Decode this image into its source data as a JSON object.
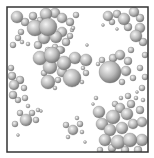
{
  "figure": {
    "background": "#ffffff",
    "box": {
      "x": 7,
      "y": 7,
      "width": 141,
      "height": 145,
      "stroke": "#333333",
      "stroke_width": 1.5
    },
    "sphere_colors": {
      "highlight": "#f4f4f4",
      "mid": "#b8b8b8",
      "shadow": "#6e6e6e"
    },
    "spheres": [
      [
        17,
        17,
        6
      ],
      [
        25,
        22,
        4
      ],
      [
        33,
        16,
        4
      ],
      [
        40,
        20,
        3
      ],
      [
        46,
        14,
        6
      ],
      [
        55,
        13,
        5
      ],
      [
        62,
        18,
        5
      ],
      [
        70,
        22,
        4
      ],
      [
        76,
        15,
        3
      ],
      [
        72,
        30,
        2
      ],
      [
        35,
        28,
        8
      ],
      [
        48,
        27,
        9
      ],
      [
        44,
        38,
        6
      ],
      [
        56,
        37,
        6
      ],
      [
        62,
        32,
        5
      ],
      [
        66,
        42,
        4
      ],
      [
        38,
        45,
        4
      ],
      [
        55,
        47,
        3
      ],
      [
        48,
        50,
        3
      ],
      [
        62,
        50,
        3
      ],
      [
        70,
        36,
        3
      ],
      [
        18,
        38,
        3
      ],
      [
        13,
        45,
        3
      ],
      [
        22,
        42,
        2
      ],
      [
        28,
        44,
        2
      ],
      [
        21,
        32,
        3
      ],
      [
        73,
        28,
        2
      ],
      [
        40,
        58,
        7
      ],
      [
        52,
        55,
        8
      ],
      [
        60,
        50,
        4
      ],
      [
        64,
        63,
        7
      ],
      [
        75,
        58,
        6
      ],
      [
        86,
        60,
        6
      ],
      [
        50,
        67,
        7
      ],
      [
        62,
        72,
        5
      ],
      [
        44,
        73,
        3
      ],
      [
        86,
        73,
        3
      ],
      [
        48,
        82,
        7
      ],
      [
        72,
        78,
        9
      ],
      [
        58,
        80,
        3
      ],
      [
        82,
        82,
        2
      ],
      [
        55,
        88,
        2
      ],
      [
        83,
        68,
        2
      ],
      [
        110,
        72,
        11
      ],
      [
        102,
        60,
        3
      ],
      [
        113,
        58,
        4
      ],
      [
        120,
        55,
        5
      ],
      [
        128,
        61,
        4
      ],
      [
        126,
        71,
        5
      ],
      [
        133,
        78,
        3
      ],
      [
        122,
        82,
        3
      ],
      [
        98,
        64,
        2
      ],
      [
        131,
        50,
        3
      ],
      [
        108,
        16,
        5
      ],
      [
        117,
        14,
        4
      ],
      [
        124,
        19,
        6
      ],
      [
        134,
        12,
        5
      ],
      [
        140,
        18,
        4
      ],
      [
        112,
        22,
        3
      ],
      [
        128,
        27,
        4
      ],
      [
        140,
        28,
        5
      ],
      [
        136,
        36,
        6
      ],
      [
        143,
        42,
        4
      ],
      [
        145,
        55,
        3
      ],
      [
        140,
        68,
        3
      ],
      [
        145,
        77,
        3
      ],
      [
        142,
        88,
        3
      ],
      [
        103,
        25,
        1.5
      ],
      [
        117,
        29,
        1.5
      ],
      [
        87,
        45,
        1.5
      ],
      [
        12,
        76,
        4
      ],
      [
        14,
        85,
        5
      ],
      [
        20,
        80,
        4
      ],
      [
        24,
        88,
        3
      ],
      [
        13,
        95,
        4
      ],
      [
        18,
        100,
        3
      ],
      [
        25,
        98,
        3
      ],
      [
        11,
        68,
        3
      ],
      [
        28,
        106,
        2
      ],
      [
        26,
        120,
        6
      ],
      [
        20,
        113,
        3
      ],
      [
        32,
        113,
        3
      ],
      [
        36,
        120,
        3
      ],
      [
        15,
        124,
        3
      ],
      [
        38,
        110,
        2
      ],
      [
        41,
        111,
        1.5
      ],
      [
        18,
        135,
        1.5
      ],
      [
        73,
        130,
        5
      ],
      [
        66,
        125,
        3
      ],
      [
        80,
        124,
        3
      ],
      [
        77,
        118,
        2
      ],
      [
        82,
        132,
        2
      ],
      [
        68,
        137,
        2
      ],
      [
        85,
        142,
        1.5
      ],
      [
        99,
        112,
        6
      ],
      [
        102,
        124,
        6
      ],
      [
        113,
        117,
        7
      ],
      [
        120,
        108,
        5
      ],
      [
        127,
        114,
        6
      ],
      [
        131,
        104,
        4
      ],
      [
        140,
        110,
        4
      ],
      [
        110,
        130,
        6
      ],
      [
        122,
        128,
        6
      ],
      [
        133,
        124,
        5
      ],
      [
        142,
        122,
        5
      ],
      [
        105,
        140,
        6
      ],
      [
        118,
        142,
        7
      ],
      [
        130,
        140,
        7
      ],
      [
        142,
        140,
        6
      ],
      [
        115,
        104,
        3
      ],
      [
        121,
        98,
        2
      ],
      [
        128,
        96,
        3
      ],
      [
        136,
        98,
        2
      ],
      [
        143,
        100,
        2
      ],
      [
        137,
        92,
        1.5
      ],
      [
        96,
        98,
        2
      ],
      [
        93,
        104,
        1.5
      ],
      [
        112,
        148,
        4
      ],
      [
        138,
        150,
        4
      ],
      [
        125,
        150,
        4
      ],
      [
        100,
        150,
        3
      ]
    ]
  }
}
